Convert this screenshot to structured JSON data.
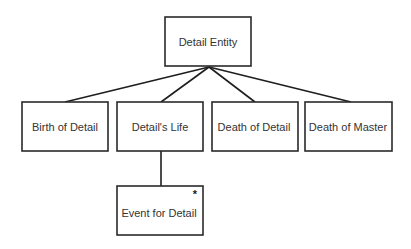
{
  "diagram": {
    "type": "jackson-structure-diagram",
    "nodes": [
      {
        "id": "root",
        "label": "Detail Entity"
      },
      {
        "id": "birth",
        "label": "Birth of Detail"
      },
      {
        "id": "life",
        "label": "Detail's Life"
      },
      {
        "id": "death-detail",
        "label": "Death of Detail"
      },
      {
        "id": "death-master",
        "label": "Death of Master"
      },
      {
        "id": "event",
        "label": "Event for Detail",
        "marker": "*"
      }
    ],
    "edges": [
      {
        "from": "root",
        "to": "birth"
      },
      {
        "from": "root",
        "to": "life"
      },
      {
        "from": "root",
        "to": "death-detail"
      },
      {
        "from": "root",
        "to": "death-master"
      },
      {
        "from": "life",
        "to": "event"
      }
    ]
  }
}
